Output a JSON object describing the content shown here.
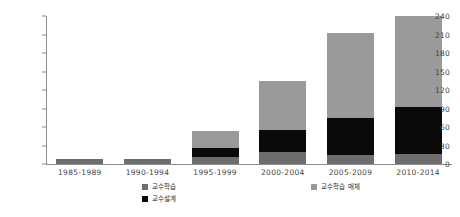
{
  "chart_data": {
    "type": "bar",
    "stacked": true,
    "title": "",
    "subtitle": "",
    "xlabel": "",
    "ylabel": "",
    "ylim": [
      0,
      240
    ],
    "ytick_step": 30,
    "yticks": [
      240,
      210,
      180,
      150,
      120,
      90,
      60,
      30,
      0
    ],
    "grid": false,
    "legend_position": "bottom",
    "categories": [
      "1985-1989",
      "1990-1994",
      "1995-1999",
      "2000-2004",
      "2005-2009",
      "2010-2014"
    ],
    "series": [
      {
        "name": "교수학습",
        "color": "#6e6e6e",
        "values": [
          8,
          8,
          12,
          20,
          15,
          17
        ]
      },
      {
        "name": "교수설계",
        "color": "#0a0a0a",
        "values": [
          0,
          0,
          14,
          35,
          60,
          75
        ]
      },
      {
        "name": "교수학습 매체",
        "color": "#9a9a9a",
        "values": [
          0,
          0,
          27,
          80,
          137,
          148
        ]
      }
    ],
    "totals": [
      8,
      8,
      53,
      135,
      212,
      240
    ]
  },
  "axis": {
    "y_tick_labels": [
      "240",
      "210",
      "180",
      "150",
      "120",
      "90",
      "60",
      "30",
      "0"
    ],
    "x_tick_labels": [
      "1985-1989",
      "1990-1994",
      "1995-1999",
      "2000-2004",
      "2005-2009",
      "2010-2014"
    ]
  },
  "legend": {
    "left_items": [
      {
        "label": "교수학습",
        "swatch": "learning"
      },
      {
        "label": "교수설계",
        "swatch": "design"
      }
    ],
    "right_items": [
      {
        "label": "교수학습 매체",
        "swatch": "media"
      }
    ]
  },
  "colors": {
    "learning": "#6e6e6e",
    "design": "#0a0a0a",
    "media": "#9a9a9a",
    "axis": "#8d8d8d",
    "text": "#3f3f3f",
    "background": "#ffffff"
  }
}
